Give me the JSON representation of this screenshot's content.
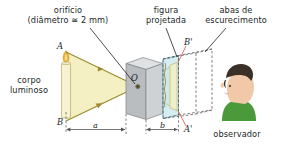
{
  "figure": {
    "type": "pinhole-camera-diagram",
    "language": "pt-BR",
    "labels": {
      "orificio_line1": "orifício",
      "orificio_line2": "(diâmetro ≅ 2 mm)",
      "figura_line1": "figura",
      "figura_line2": "projetada",
      "abas_line1": "abas de",
      "abas_line2": "escurecimento",
      "corpo_line1": "corpo",
      "corpo_line2": "luminoso",
      "observador": "observador"
    },
    "points": {
      "A": "A",
      "B": "B",
      "O": "O",
      "A_prime": "B'",
      "B_prime": "A'"
    },
    "dimensions": {
      "a": "a",
      "b": "b"
    },
    "colors": {
      "light_cone": "#f5f0c3",
      "ray_line": "#9a8b2e",
      "box_face": "#c9ccce",
      "box_side": "#a9adb0",
      "box_top": "#dfe1e2",
      "screen": "#c7e6ec",
      "candle": "#f7f2d2",
      "flame": "#e8b33a",
      "skin": "#f2c9a8",
      "hair": "#3b3027",
      "shirt": "#4a9a3c",
      "text": "#221f1f",
      "dashed": "#55524f",
      "pointer": "#d9534f"
    }
  },
  "credit": {
    "text": "Banco de imagens/\nArquivo da editora"
  }
}
